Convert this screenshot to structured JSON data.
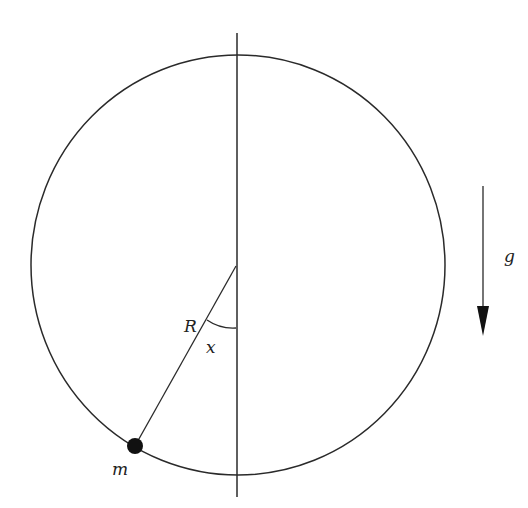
{
  "diagram": {
    "labels": {
      "radius": "R",
      "angle": "x",
      "mass": "m",
      "gravity": "g"
    },
    "colors": {
      "stroke": "#2a2a2a",
      "background": "#ffffff",
      "mass_fill": "#111111"
    }
  }
}
